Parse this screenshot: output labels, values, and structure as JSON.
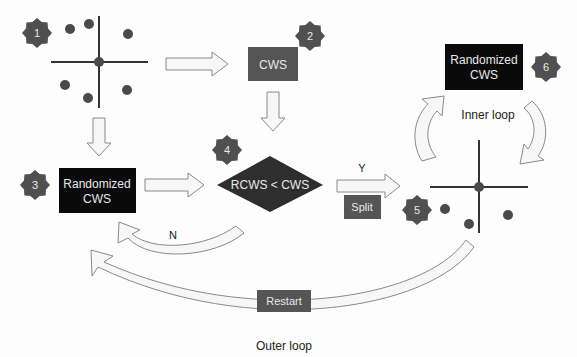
{
  "colors": {
    "dark_box": "#555555",
    "black_box": "#0a0a0a",
    "star": "#505050",
    "arrow_fill": "#f7f7f7",
    "arrow_stroke": "#8a8a8a",
    "line": "#333333",
    "dot": "#4a4a4a",
    "text_dark": "#222222",
    "text_light": "#e8e8e8"
  },
  "steps": [
    {
      "id": 1,
      "label": "1"
    },
    {
      "id": 2,
      "label": "2"
    },
    {
      "id": 3,
      "label": "3"
    },
    {
      "id": 4,
      "label": "4"
    },
    {
      "id": 5,
      "label": "5"
    },
    {
      "id": 6,
      "label": "6"
    }
  ],
  "nodes": {
    "cws": {
      "label": "CWS"
    },
    "randomized_left": {
      "line1": "Randomized",
      "line2": "CWS"
    },
    "randomized_top_right": {
      "line1": "Randomized",
      "line2": "CWS"
    },
    "decision": {
      "label": "RCWS < CWS"
    },
    "split": {
      "label": "Split"
    },
    "restart": {
      "label": "Restart"
    }
  },
  "edge_labels": {
    "yes": "Y",
    "no": "N"
  },
  "loops": {
    "inner": "Inner loop",
    "outer": "Outer loop"
  }
}
